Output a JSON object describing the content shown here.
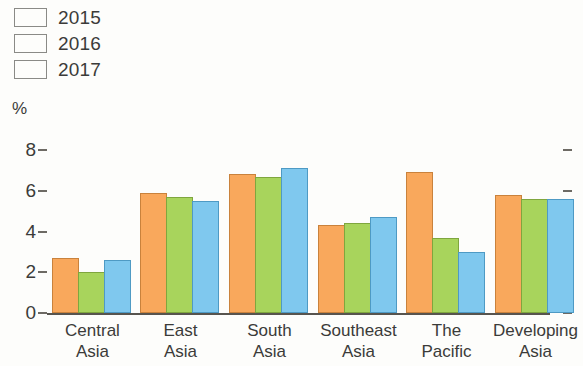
{
  "legend": {
    "items": [
      {
        "label": "2015",
        "color": "#F9A85C"
      },
      {
        "label": "2016",
        "color": "#A8D45C"
      },
      {
        "label": "2017",
        "color": "#7FC8EE"
      }
    ]
  },
  "axis": {
    "unit_label": "%",
    "y_ticks": [
      "8",
      "6",
      "4",
      "2",
      "0"
    ]
  },
  "chart_data": {
    "type": "bar",
    "title": "",
    "subtitle": "",
    "xlabel": "",
    "ylabel": "%",
    "ylim": [
      0,
      8
    ],
    "ytick_values": [
      0,
      2,
      4,
      6,
      8
    ],
    "grid": false,
    "legend_position": "top-left",
    "categories": [
      "Central\nAsia",
      "East\nAsia",
      "South\nAsia",
      "Southeast\nAsia",
      "The\nPacific",
      "Developing\nAsia"
    ],
    "series": [
      {
        "name": "2015",
        "color": "#F9A85C",
        "values": [
          2.7,
          5.9,
          6.8,
          4.3,
          6.9,
          5.8
        ]
      },
      {
        "name": "2016",
        "color": "#A8D45C",
        "values": [
          2.0,
          5.7,
          6.7,
          4.4,
          3.7,
          5.6
        ]
      },
      {
        "name": "2017",
        "color": "#7FC8EE",
        "values": [
          2.6,
          5.5,
          7.1,
          4.7,
          3.0,
          5.6
        ]
      }
    ]
  }
}
